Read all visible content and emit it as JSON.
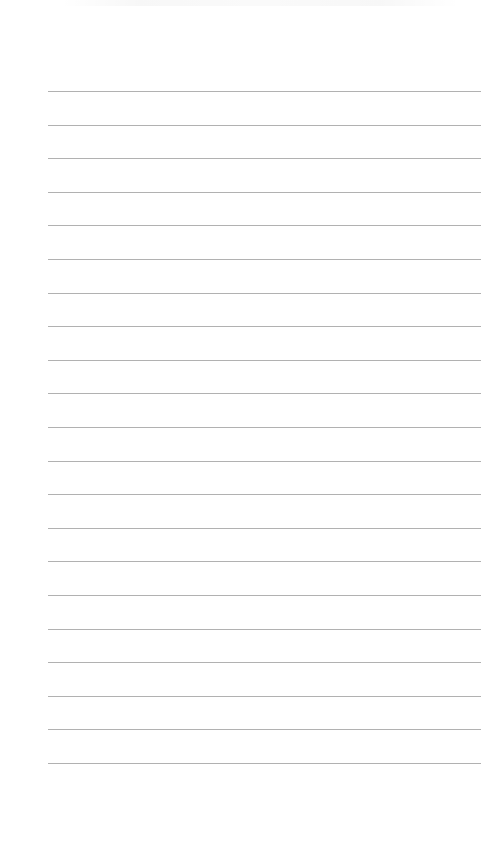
{
  "document": {
    "type": "lined-paper",
    "background_color": "#ffffff",
    "rule_color": "#a9a9a9",
    "rule_count": 21,
    "rule_start_y": 91,
    "rule_spacing": 33.6,
    "rule_left": 48,
    "rule_right": 481,
    "text": ""
  }
}
